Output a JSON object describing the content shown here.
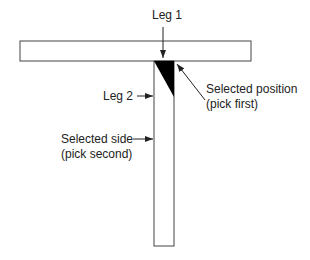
{
  "diagram": {
    "labels": {
      "leg1": "Leg 1",
      "leg2": "Leg 2",
      "selected_position_line1": "Selected position",
      "selected_position_line2": "(pick first)",
      "selected_side_line1": "Selected side",
      "selected_side_line2": "(pick second)"
    },
    "colors": {
      "stroke": "#333333",
      "fill_triangle": "#000000",
      "background": "#ffffff"
    }
  }
}
